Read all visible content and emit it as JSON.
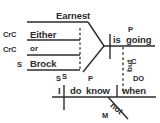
{
  "diagram": {
    "type": "reed-kellogg-sentence-diagram",
    "ink_color": "#2b2b2b",
    "background_color": "#ffffff",
    "compound_subject": {
      "correlative_1": {
        "tag": "CrC",
        "word": "Either"
      },
      "correlative_2": {
        "tag": "CrC",
        "word": "or"
      },
      "noun_1": {
        "tag": "",
        "word": "Earnest"
      },
      "noun_2": {
        "tag": "S",
        "word": "Brock"
      },
      "brace_tag": "S"
    },
    "main_clause_1": {
      "subject_tag": "",
      "predicate_tag": "P",
      "predicate_word_1": "is",
      "predicate_word_2": "going"
    },
    "conjunction": {
      "word": "but",
      "tag": "C"
    },
    "main_clause_2": {
      "subject_tag": "S",
      "subject_word": "I",
      "predicate_tag": "P",
      "predicate_word_1": "do",
      "predicate_word_2": "know",
      "object_tag": "DO",
      "object_word": "when",
      "modifier_word": "not",
      "modifier_tag": "M"
    }
  }
}
